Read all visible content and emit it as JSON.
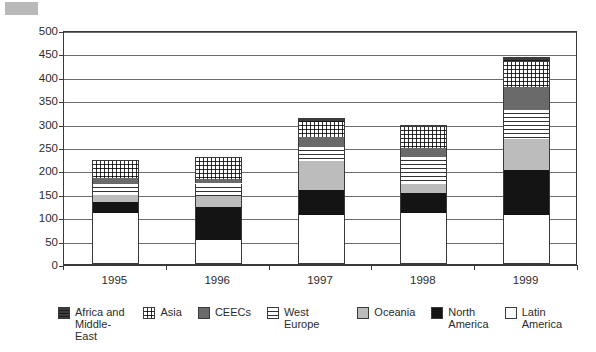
{
  "chart_data": {
    "type": "bar",
    "stacked": true,
    "title": "",
    "xlabel": "",
    "ylabel": "",
    "categories": [
      "1995",
      "1996",
      "1997",
      "1998",
      "1999"
    ],
    "ylim": [
      0,
      500
    ],
    "ytick_values": [
      0,
      50,
      100,
      150,
      200,
      250,
      300,
      350,
      400,
      450,
      500
    ],
    "ytick_labels": [
      "0",
      "50",
      "100",
      "150",
      "200",
      "250",
      "300",
      "350",
      "400",
      "450",
      "500"
    ],
    "grid": true,
    "grid_axis": "y",
    "legend_position": "bottom",
    "stack_order_bottom_to_top": [
      "Latin America",
      "North America",
      "Oceania",
      "West Europe",
      "CEECs",
      "Asia",
      "Africa and Middle-East"
    ],
    "series": [
      {
        "name": "Latin America",
        "pattern": "solid-white",
        "color": "#ffffff",
        "values": [
          108,
          52,
          105,
          108,
          105
        ]
      },
      {
        "name": "North America",
        "pattern": "solid-black",
        "color": "#141414",
        "values": [
          25,
          70,
          53,
          43,
          95
        ]
      },
      {
        "name": "Oceania",
        "pattern": "solid-light-gray",
        "color": "#bcbcbc",
        "values": [
          15,
          23,
          62,
          19,
          67
        ]
      },
      {
        "name": "West Europe",
        "pattern": "horizontal-lines",
        "color": "#ffffff",
        "values": [
          22,
          27,
          30,
          59,
          63
        ]
      },
      {
        "name": "CEECs",
        "pattern": "solid-medium-gray",
        "color": "#6a6a6a",
        "values": [
          14,
          10,
          22,
          19,
          48
        ]
      },
      {
        "name": "Asia",
        "pattern": "grid-dots",
        "color": "#ffffff",
        "values": [
          36,
          44,
          31,
          45,
          54
        ]
      },
      {
        "name": "Africa and Middle-East",
        "pattern": "dense-horizontal",
        "color": "#3d3d3d",
        "values": [
          2,
          2,
          8,
          4,
          10
        ]
      }
    ],
    "cumulative_tops": {
      "1995": [
        108,
        133,
        148,
        170,
        184,
        220,
        222
      ],
      "1996": [
        52,
        122,
        145,
        172,
        182,
        226,
        228
      ],
      "1997": [
        105,
        158,
        220,
        250,
        272,
        303,
        311
      ],
      "1998": [
        108,
        151,
        170,
        229,
        248,
        293,
        297
      ],
      "1999": [
        105,
        200,
        267,
        330,
        378,
        432,
        442
      ]
    },
    "totals": [
      222,
      228,
      311,
      297,
      442
    ]
  },
  "legend": {
    "items": [
      {
        "label": "Africa and\nMiddle-East",
        "swatch": "dense-horizontal"
      },
      {
        "label": "Asia",
        "swatch": "grid-dots"
      },
      {
        "label": "CEECs",
        "swatch": "solid-medium-gray"
      },
      {
        "label": "West Europe",
        "swatch": "horizontal-lines"
      },
      {
        "label": "Oceania",
        "swatch": "solid-light-gray"
      },
      {
        "label": "North\nAmerica",
        "swatch": "solid-black"
      },
      {
        "label": "Latin\nAmerica",
        "swatch": "solid-white"
      }
    ]
  },
  "colors": {
    "axis": "#3a3a3a",
    "grid": "#6d6d6d",
    "text": "#2b2b2b",
    "corner_block": "#b9b9b9",
    "background": "#ffffff"
  }
}
